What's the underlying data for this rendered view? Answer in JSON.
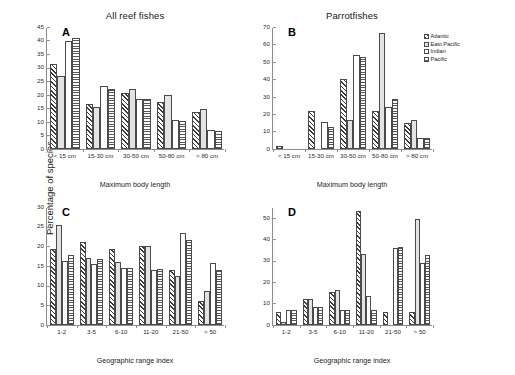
{
  "figure": {
    "ylabel": "Percentage of species",
    "legend": {
      "items": [
        {
          "label": "Atlantic",
          "pattern": "diagonal-hatch"
        },
        {
          "label": "East Pacific",
          "pattern": "light-gray-solid"
        },
        {
          "label": "Indian",
          "pattern": "white-plain"
        },
        {
          "label": "Pacific",
          "pattern": "horizontal-stripes"
        }
      ]
    }
  },
  "chart_data": [
    {
      "type": "bar",
      "panel": "A",
      "title": "All reef fishes",
      "xlabel": "Maximum body length",
      "ylabel": "Percentage of species",
      "categories": [
        "< 15 cm",
        "15-30 cm",
        "30-50 cm",
        "50-80 cm",
        "> 80 cm"
      ],
      "series": [
        {
          "name": "Atlantic",
          "values": [
            31.5,
            16.7,
            20.5,
            17.3,
            13.8
          ]
        },
        {
          "name": "East Pacific",
          "values": [
            26.8,
            15.4,
            22.3,
            20.1,
            14.8
          ]
        },
        {
          "name": "Indian",
          "values": [
            40.0,
            23.4,
            18.3,
            10.6,
            6.9
          ]
        },
        {
          "name": "Pacific",
          "values": [
            41.1,
            22.1,
            18.3,
            10.5,
            6.8
          ]
        }
      ],
      "ylim": [
        0,
        45
      ],
      "yticks": [
        0,
        5,
        10,
        15,
        20,
        25,
        30,
        35,
        40,
        45
      ],
      "grid": false
    },
    {
      "type": "bar",
      "panel": "B",
      "title": "Parrotfishes",
      "xlabel": "Maximum body length",
      "ylabel": "Percentage of species",
      "categories": [
        "< 15 cm",
        "15-30 cm",
        "30-50 cm",
        "50-80 cm",
        "> 80 cm"
      ],
      "series": [
        {
          "name": "Atlantic",
          "values": [
            1.5,
            21.6,
            40.4,
            21.6,
            14.8
          ]
        },
        {
          "name": "East Pacific",
          "values": [
            0.0,
            0.0,
            16.4,
            66.5,
            16.4
          ]
        },
        {
          "name": "Indian",
          "values": [
            0.0,
            15.7,
            53.9,
            24.0,
            6.2
          ]
        },
        {
          "name": "Pacific",
          "values": [
            0.0,
            12.4,
            52.8,
            28.5,
            6.2
          ]
        }
      ],
      "ylim": [
        0,
        70
      ],
      "yticks": [
        0,
        10,
        20,
        30,
        40,
        50,
        60,
        70
      ],
      "grid": false
    },
    {
      "type": "bar",
      "panel": "C",
      "title": "",
      "xlabel": "Geographic range index",
      "ylabel": "Percentage of species",
      "categories": [
        "1-2",
        "3-5",
        "6-10",
        "11-20",
        "21-50",
        "> 50"
      ],
      "series": [
        {
          "name": "Atlantic",
          "values": [
            19.3,
            21.2,
            19.3,
            20.1,
            14.1,
            6.0
          ]
        },
        {
          "name": "East Pacific",
          "values": [
            25.4,
            17.0,
            16.0,
            20.0,
            12.5,
            8.6
          ]
        },
        {
          "name": "Indian",
          "values": [
            16.2,
            15.4,
            14.6,
            14.0,
            23.5,
            15.7
          ]
        },
        {
          "name": "Pacific",
          "values": [
            17.9,
            16.7,
            14.6,
            14.3,
            21.7,
            14.0
          ]
        }
      ],
      "ylim": [
        0,
        30
      ],
      "yticks": [
        0,
        5,
        10,
        15,
        20,
        25,
        30
      ],
      "grid": false
    },
    {
      "type": "bar",
      "panel": "D",
      "title": "",
      "xlabel": "Geographic range index",
      "ylabel": "Percentage of species",
      "categories": [
        "1-2",
        "3-5",
        "6-10",
        "11-20",
        "21-50",
        "> 50"
      ],
      "series": [
        {
          "name": "Atlantic",
          "values": [
            6.2,
            12.3,
            15.4,
            53.0,
            6.2,
            6.2
          ]
        },
        {
          "name": "East Pacific",
          "values": [
            1.4,
            12.0,
            16.4,
            33.0,
            0.0,
            49.6
          ]
        },
        {
          "name": "Indian",
          "values": [
            7.0,
            8.5,
            6.8,
            13.4,
            35.9,
            29.0
          ]
        },
        {
          "name": "Pacific",
          "values": [
            7.0,
            8.5,
            6.8,
            6.8,
            36.5,
            32.8
          ]
        }
      ],
      "ylim": [
        0,
        55
      ],
      "yticks": [
        0,
        10,
        20,
        30,
        40,
        50
      ],
      "grid": false
    }
  ]
}
